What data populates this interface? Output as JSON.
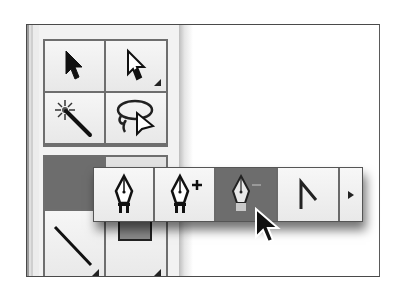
{
  "toolbox": {
    "tools_top": [
      {
        "name": "Selection Tool",
        "icon": "arrow-icon",
        "has_flyout": false
      },
      {
        "name": "Direct Selection Tool",
        "icon": "hollow-arrow-icon",
        "has_flyout": true
      },
      {
        "name": "Magic Wand Tool",
        "icon": "magic-wand-icon",
        "has_flyout": false
      },
      {
        "name": "Lasso Tool",
        "icon": "lasso-icon",
        "has_flyout": false
      }
    ],
    "tools_bottom": [
      {
        "name": "Pen Tool",
        "icon": "pen-icon",
        "state": "pressed"
      },
      {
        "name": "Type Tool",
        "icon": "type-icon",
        "state": "normal"
      },
      {
        "name": "Line Segment Tool",
        "icon": "line-icon",
        "has_flyout": true
      },
      {
        "name": "Rectangle Tool",
        "icon": "rectangle-icon",
        "has_flyout": true
      }
    ]
  },
  "flyout": {
    "items": [
      {
        "name": "Pen Tool",
        "icon": "pen-icon",
        "active": false
      },
      {
        "name": "Add Anchor Point Tool",
        "icon": "pen-plus-icon",
        "active": false
      },
      {
        "name": "Delete Anchor Point Tool",
        "icon": "pen-minus-icon",
        "active": true
      },
      {
        "name": "Convert Anchor Point Tool",
        "icon": "convert-anchor-icon",
        "active": false
      }
    ],
    "tearoff": {
      "name": "Tearoff",
      "icon": "triangle-right-icon"
    }
  },
  "colors": {
    "highlight": "#6d6d6d",
    "border": "#6e6e6e",
    "panel": "#f2f2f2"
  }
}
